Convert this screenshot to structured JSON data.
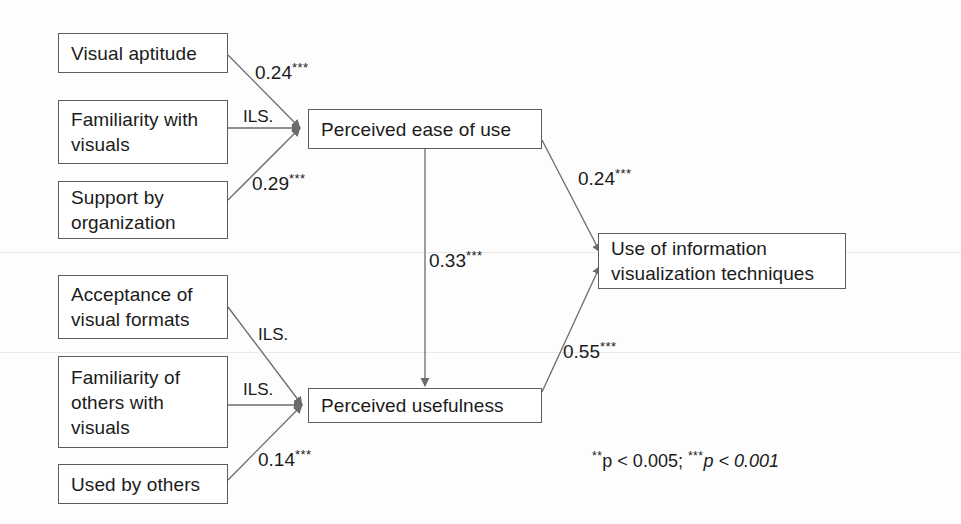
{
  "diagram": {
    "nodes": [
      {
        "id": "visual-aptitude",
        "label": "Visual aptitude",
        "x": 58,
        "y": 33,
        "w": 170,
        "h": 40
      },
      {
        "id": "familiarity-visuals",
        "label": "Familiarity with\nvisuals",
        "x": 58,
        "y": 100,
        "w": 170,
        "h": 64
      },
      {
        "id": "support-organization",
        "label": "Support by\norganization",
        "x": 58,
        "y": 181,
        "w": 170,
        "h": 58
      },
      {
        "id": "acceptance-formats",
        "label": "Acceptance of\nvisual formats",
        "x": 58,
        "y": 275,
        "w": 170,
        "h": 64
      },
      {
        "id": "familiarity-others",
        "label": "Familiarity of\nothers with\nvisuals",
        "x": 58,
        "y": 356,
        "w": 170,
        "h": 92
      },
      {
        "id": "used-by-others",
        "label": "Used by others",
        "x": 58,
        "y": 464,
        "w": 170,
        "h": 40
      },
      {
        "id": "perceived-ease-of-use",
        "label": "Perceived ease of use",
        "x": 308,
        "y": 109,
        "w": 234,
        "h": 40
      },
      {
        "id": "perceived-usefulness",
        "label": "Perceived usefulness",
        "x": 308,
        "y": 388,
        "w": 234,
        "h": 35
      },
      {
        "id": "use-of-infoviz",
        "label": "Use of information\nvisualization techniques",
        "x": 598,
        "y": 233,
        "w": 248,
        "h": 56
      }
    ],
    "edges": [
      {
        "id": "aptitude-to-ease",
        "from": "visual-aptitude",
        "to": "perceived-ease-of-use",
        "label": "0.24",
        "stars": "***",
        "label_x": 255,
        "label_y": 61
      },
      {
        "id": "familiarity-to-ease",
        "from": "familiarity-visuals",
        "to": "perceived-ease-of-use",
        "label": "ILS.",
        "stars": "",
        "label_x": 243,
        "label_y": 108
      },
      {
        "id": "support-to-ease",
        "from": "support-organization",
        "to": "perceived-ease-of-use",
        "label": "0.29",
        "stars": "***",
        "label_x": 252,
        "label_y": 172
      },
      {
        "id": "acceptance-to-usefulness",
        "from": "acceptance-formats",
        "to": "perceived-usefulness",
        "label": "ILS.",
        "stars": "",
        "label_x": 258,
        "label_y": 326
      },
      {
        "id": "familiarity-others-to-usefulness",
        "from": "familiarity-others",
        "to": "perceived-usefulness",
        "label": "ILS.",
        "stars": "",
        "label_x": 243,
        "label_y": 381
      },
      {
        "id": "used-by-others-to-usefulness",
        "from": "used-by-others",
        "to": "perceived-usefulness",
        "label": "0.14",
        "stars": "***",
        "label_x": 258,
        "label_y": 448
      },
      {
        "id": "ease-to-usefulness",
        "from": "perceived-ease-of-use",
        "to": "perceived-usefulness",
        "label": "0.33",
        "stars": "***",
        "label_x": 429,
        "label_y": 249
      },
      {
        "id": "ease-to-use",
        "from": "perceived-ease-of-use",
        "to": "use-of-infoviz",
        "label": "0.24",
        "stars": "***",
        "label_x": 578,
        "label_y": 167
      },
      {
        "id": "usefulness-to-use",
        "from": "perceived-usefulness",
        "to": "use-of-infoviz",
        "label": "0.55",
        "stars": "***",
        "label_x": 563,
        "label_y": 340
      }
    ],
    "legend": {
      "star2": "**",
      "p1": "p < 0.005;",
      "star3": "***",
      "p2": "p < 0.001",
      "x": 592,
      "y": 450
    },
    "colors": {
      "box_border": "#5d5d5d",
      "edge_stroke": "#6b6b6b",
      "text": "#1b1b1b",
      "background": "#fdfdfd"
    }
  }
}
